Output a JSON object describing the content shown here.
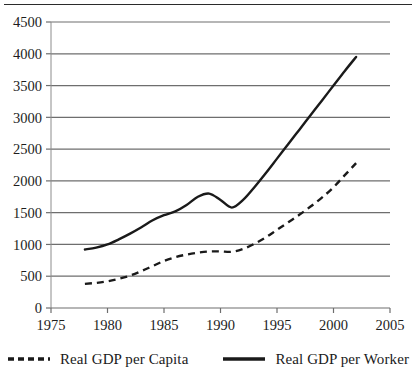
{
  "chart_data": {
    "type": "line",
    "title": "",
    "xlabel": "",
    "ylabel": "",
    "xlim": [
      1975,
      2005
    ],
    "ylim": [
      0,
      4500
    ],
    "xticks": [
      1975,
      1980,
      1985,
      1990,
      1995,
      2000,
      2005
    ],
    "yticks": [
      0,
      500,
      1000,
      1500,
      2000,
      2500,
      3000,
      3500,
      4000,
      4500
    ],
    "grid": "horizontal",
    "legend_position": "below",
    "series": [
      {
        "name": "Real GDP per Capita",
        "style": "dashed",
        "color": "#1a1a1a",
        "x": [
          1978,
          1979,
          1980,
          1981,
          1982,
          1983,
          1984,
          1985,
          1986,
          1987,
          1988,
          1989,
          1990,
          1991,
          1992,
          1993,
          1994,
          1995,
          1996,
          1997,
          1998,
          1999,
          2000,
          2001,
          2002
        ],
        "values": [
          380,
          395,
          420,
          460,
          510,
          580,
          660,
          740,
          800,
          840,
          870,
          890,
          890,
          885,
          930,
          1010,
          1110,
          1230,
          1350,
          1470,
          1600,
          1740,
          1900,
          2090,
          2280
        ]
      },
      {
        "name": "Real GDP per Worker",
        "style": "solid",
        "color": "#1a1a1a",
        "x": [
          1978,
          1979,
          1980,
          1981,
          1982,
          1983,
          1984,
          1985,
          1986,
          1987,
          1988,
          1989,
          1990,
          1991,
          1992,
          1993,
          1994,
          1995,
          1996,
          1997,
          1998,
          1999,
          2000,
          2001,
          2002
        ],
        "values": [
          920,
          950,
          1000,
          1080,
          1170,
          1270,
          1380,
          1460,
          1520,
          1620,
          1750,
          1800,
          1700,
          1580,
          1700,
          1900,
          2120,
          2350,
          2580,
          2810,
          3040,
          3270,
          3500,
          3730,
          3950
        ]
      }
    ]
  },
  "legend": {
    "items": [
      {
        "label": "Real GDP per Capita",
        "style": "dashed"
      },
      {
        "label": "Real GDP per Worker",
        "style": "solid"
      }
    ]
  },
  "axes": {
    "y_tick_labels": [
      "4500",
      "4000",
      "3500",
      "3000",
      "2500",
      "2000",
      "1500",
      "1000",
      "500",
      "0"
    ],
    "x_tick_labels": [
      "1975",
      "1980",
      "1985",
      "1990",
      "1995",
      "2000",
      "2005"
    ]
  }
}
